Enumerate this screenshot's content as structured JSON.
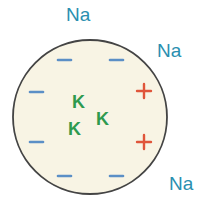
{
  "diagram": {
    "cell": {
      "fill": "#f8f4e4",
      "stroke": "#444444",
      "cx": 90,
      "cy": 117,
      "r": 77
    },
    "outside_ions": [
      {
        "label": "Na",
        "x": 66,
        "y": 4
      },
      {
        "label": "Na",
        "x": 157,
        "y": 40
      },
      {
        "label": "Na",
        "x": 169,
        "y": 173
      }
    ],
    "inside_ions": [
      {
        "label": "K",
        "x": 72,
        "y": 94
      },
      {
        "label": "K",
        "x": 68,
        "y": 121
      },
      {
        "label": "K",
        "x": 96,
        "y": 111
      }
    ],
    "negative_charges": [
      {
        "x": 58,
        "y": 59
      },
      {
        "x": 110,
        "y": 59
      },
      {
        "x": 30,
        "y": 92
      },
      {
        "x": 30,
        "y": 142
      },
      {
        "x": 58,
        "y": 175
      },
      {
        "x": 110,
        "y": 175
      }
    ],
    "positive_charges": [
      {
        "x": 145,
        "y": 90
      },
      {
        "x": 145,
        "y": 142
      }
    ],
    "colors": {
      "negative": "#5b8fc6",
      "positive": "#e0553a",
      "na": "#2a8fb0",
      "k": "#2e9a4e"
    }
  }
}
